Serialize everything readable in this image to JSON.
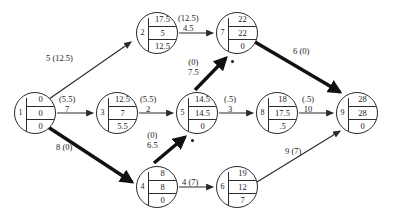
{
  "diagram": {
    "type": "activity-on-arrow network diagram",
    "canvas": {
      "width": 393,
      "height": 222
    },
    "colors": {
      "stroke": "#2b2b2b",
      "text": "#1a1a1a",
      "critical_edge": "#111111",
      "background": "#ffffff"
    },
    "nodes": [
      {
        "id": "1",
        "label": "1",
        "cells": [
          "0",
          "0",
          "0"
        ],
        "x": 14,
        "y": 92
      },
      {
        "id": "2",
        "label": "2",
        "cells": [
          "17.5",
          "5",
          "12.5"
        ],
        "x": 136,
        "y": 12
      },
      {
        "id": "3",
        "label": "3",
        "cells": [
          "12.5",
          "7",
          "5.5"
        ],
        "x": 96,
        "y": 92
      },
      {
        "id": "4",
        "label": "4",
        "cells": [
          "8",
          "8",
          "0"
        ],
        "x": 136,
        "y": 166
      },
      {
        "id": "5",
        "label": "5",
        "cells": [
          "14.5",
          "14.5",
          "0"
        ],
        "x": 176,
        "y": 92
      },
      {
        "id": "6",
        "label": "6",
        "cells": [
          "19",
          "12",
          "7"
        ],
        "x": 216,
        "y": 166
      },
      {
        "id": "7",
        "label": "7",
        "cells": [
          "22",
          "22",
          "0"
        ],
        "x": 216,
        "y": 12
      },
      {
        "id": "8",
        "label": "8",
        "cells": [
          "18",
          "17.5",
          ".5"
        ],
        "x": 256,
        "y": 92
      },
      {
        "id": "9",
        "label": "9",
        "cells": [
          "28",
          "28",
          "0"
        ],
        "x": 336,
        "y": 92
      }
    ],
    "edges": [
      {
        "from": "1",
        "to": "2",
        "duration": "5",
        "float": "(12.5)",
        "label_inline": "5 (12.5)",
        "critical": false,
        "dot": false,
        "label_x": 46,
        "label_y": 54,
        "path": {
          "x1": 49,
          "y1": 99,
          "x2": 131,
          "y2": 42
        }
      },
      {
        "from": "1",
        "to": "3",
        "duration": "7",
        "float": "(5.5)",
        "label_top": "(5.5)",
        "label_bottom": "7",
        "critical": false,
        "dot": false,
        "label_x": 59,
        "label_y": 95,
        "path": {
          "x1": 57,
          "y1": 113,
          "x2": 93,
          "y2": 113
        }
      },
      {
        "from": "1",
        "to": "4",
        "duration": "8",
        "float": "(0)",
        "label_inline": "8 (0)",
        "critical": true,
        "dot": false,
        "label_x": 56,
        "label_y": 143,
        "path": {
          "x1": 48,
          "y1": 127,
          "x2": 132,
          "y2": 182
        }
      },
      {
        "from": "3",
        "to": "5",
        "duration": "2",
        "float": "(5.5)",
        "label_top": "(5.5)",
        "label_bottom": "2",
        "critical": false,
        "dot": false,
        "label_x": 140,
        "label_y": 95,
        "path": {
          "x1": 139,
          "y1": 113,
          "x2": 173,
          "y2": 113
        }
      },
      {
        "from": "2",
        "to": "7",
        "duration": "4.5",
        "float": "(12.5)",
        "label_top": "(12.5)",
        "label_bottom": "4.5",
        "critical": false,
        "dot": false,
        "label_x": 178,
        "label_y": 14,
        "path": {
          "x1": 179,
          "y1": 33,
          "x2": 213,
          "y2": 33
        }
      },
      {
        "from": "4",
        "to": "5",
        "duration": "6.5",
        "float": "(0)",
        "label_top": "(0)",
        "label_bottom": "6.5",
        "critical": true,
        "dot": true,
        "label_x": 147,
        "label_y": 131,
        "path": {
          "x1": 154,
          "y1": 163,
          "x2": 185,
          "y2": 137
        },
        "dot_x": 191,
        "dot_y": 139
      },
      {
        "from": "5",
        "to": "7",
        "duration": "7.5",
        "float": "(0)",
        "label_top": "(0)",
        "label_bottom": "7.5",
        "critical": true,
        "dot": true,
        "label_x": 188,
        "label_y": 58,
        "path": {
          "x1": 195,
          "y1": 90,
          "x2": 226,
          "y2": 58
        },
        "dot_x": 231,
        "dot_y": 60
      },
      {
        "from": "5",
        "to": "8",
        "duration": "3",
        "float": "(.5)",
        "label_top": "(.5)",
        "label_bottom": "3",
        "critical": false,
        "dot": false,
        "label_x": 224,
        "label_y": 95,
        "path": {
          "x1": 219,
          "y1": 113,
          "x2": 253,
          "y2": 113
        }
      },
      {
        "from": "4",
        "to": "6",
        "duration": "4",
        "float": "(7)",
        "label_inline": "4 (7)",
        "critical": false,
        "dot": false,
        "label_x": 182,
        "label_y": 178,
        "path": {
          "x1": 179,
          "y1": 187,
          "x2": 213,
          "y2": 187
        }
      },
      {
        "from": "8",
        "to": "9",
        "duration": "10",
        "float": "(.5)",
        "label_top": "(.5)",
        "label_bottom": "10",
        "critical": false,
        "dot": false,
        "label_x": 302,
        "label_y": 95,
        "path": {
          "x1": 299,
          "y1": 113,
          "x2": 333,
          "y2": 113
        }
      },
      {
        "from": "7",
        "to": "9",
        "duration": "6",
        "float": "(0)",
        "label_inline": "6 (0)",
        "critical": true,
        "dot": true,
        "label_x": 293,
        "label_y": 47,
        "path": {
          "x1": 255,
          "y1": 42,
          "x2": 340,
          "y2": 92
        },
        "dot_x": 334,
        "dot_y": 85
      },
      {
        "from": "6",
        "to": "9",
        "duration": "9",
        "float": "(7)",
        "label_inline": "9 (7)",
        "critical": false,
        "dot": false,
        "label_x": 285,
        "label_y": 147,
        "path": {
          "x1": 257,
          "y1": 182,
          "x2": 340,
          "y2": 131
        }
      }
    ]
  }
}
